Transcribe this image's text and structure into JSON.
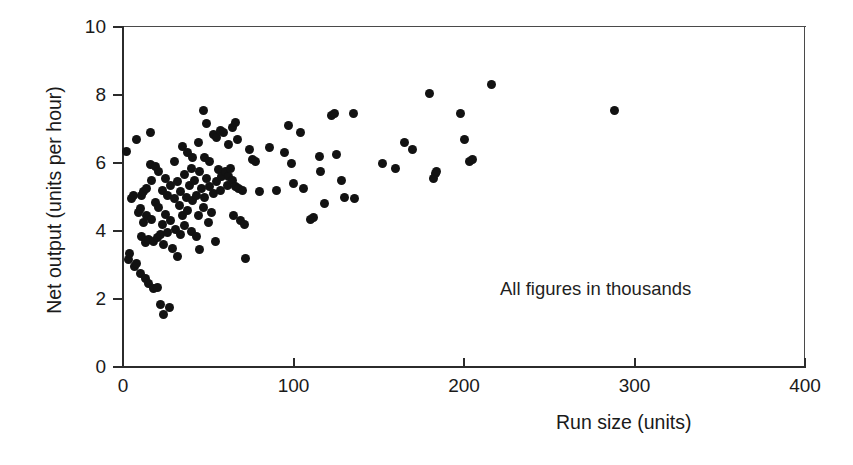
{
  "figure": {
    "background_color": "#ffffff",
    "ink_color": "#121212",
    "frame_color": "#2b2b2b"
  },
  "annotation": {
    "text": "All figures in thousands"
  },
  "chart_data": {
    "type": "scatter",
    "title": "",
    "subtitle": "",
    "xlabel": "Run size (units)",
    "ylabel": "Net output (units per hour)",
    "xlim": [
      0,
      400
    ],
    "ylim": [
      0,
      10
    ],
    "xticks": [
      0,
      100,
      200,
      300,
      400
    ],
    "yticks": [
      0,
      2,
      4,
      6,
      8,
      10
    ],
    "xtick_labels": [
      "0",
      "100",
      "200",
      "300",
      "400"
    ],
    "ytick_labels": [
      "0",
      "2",
      "4",
      "6",
      "8",
      "10"
    ],
    "grid": false,
    "legend": null,
    "legend_position": "none",
    "annotations": [
      {
        "text": "All figures in thousands",
        "x": 222,
        "y": 2.55
      }
    ],
    "marker": {
      "shape": "circle",
      "size": 9,
      "color": "#121212"
    },
    "series": [
      {
        "name": "Production runs",
        "n_points": 152,
        "points": [
          [
            2,
            6.35
          ],
          [
            3,
            3.15
          ],
          [
            4,
            3.35
          ],
          [
            5,
            4.95
          ],
          [
            6,
            5.05
          ],
          [
            7,
            2.95
          ],
          [
            8,
            3.05
          ],
          [
            8,
            6.7
          ],
          [
            9,
            4.55
          ],
          [
            10,
            4.65
          ],
          [
            10,
            2.75
          ],
          [
            11,
            5.05
          ],
          [
            11,
            3.85
          ],
          [
            12,
            5.15
          ],
          [
            12,
            4.25
          ],
          [
            13,
            3.65
          ],
          [
            13,
            2.6
          ],
          [
            14,
            5.25
          ],
          [
            14,
            4.45
          ],
          [
            15,
            3.75
          ],
          [
            15,
            2.45
          ],
          [
            16,
            6.9
          ],
          [
            16,
            5.95
          ],
          [
            17,
            5.5
          ],
          [
            17,
            4.35
          ],
          [
            18,
            3.7
          ],
          [
            18,
            2.3
          ],
          [
            19,
            5.9
          ],
          [
            19,
            4.85
          ],
          [
            20,
            3.8
          ],
          [
            20,
            2.35
          ],
          [
            21,
            5.75
          ],
          [
            21,
            4.7
          ],
          [
            22,
            3.9
          ],
          [
            22,
            1.85
          ],
          [
            23,
            5.2
          ],
          [
            23,
            4.2
          ],
          [
            24,
            3.6
          ],
          [
            24,
            1.55
          ],
          [
            25,
            5.55
          ],
          [
            25,
            4.5
          ],
          [
            26,
            5.05
          ],
          [
            26,
            3.95
          ],
          [
            27,
            1.75
          ],
          [
            28,
            5.35
          ],
          [
            28,
            4.3
          ],
          [
            29,
            3.5
          ],
          [
            30,
            6.05
          ],
          [
            30,
            4.95
          ],
          [
            31,
            4.05
          ],
          [
            32,
            5.45
          ],
          [
            32,
            3.25
          ],
          [
            33,
            4.75
          ],
          [
            34,
            5.15
          ],
          [
            34,
            3.9
          ],
          [
            35,
            6.5
          ],
          [
            35,
            4.45
          ],
          [
            36,
            5.65
          ],
          [
            36,
            4.15
          ],
          [
            37,
            5.0
          ],
          [
            38,
            6.3
          ],
          [
            38,
            4.6
          ],
          [
            39,
            5.35
          ],
          [
            40,
            5.85
          ],
          [
            40,
            4.0
          ],
          [
            41,
            6.15
          ],
          [
            41,
            4.9
          ],
          [
            42,
            5.5
          ],
          [
            43,
            5.05
          ],
          [
            43,
            3.85
          ],
          [
            44,
            6.6
          ],
          [
            44,
            4.45
          ],
          [
            45,
            5.75
          ],
          [
            45,
            3.45
          ],
          [
            46,
            5.25
          ],
          [
            47,
            7.55
          ],
          [
            47,
            4.7
          ],
          [
            48,
            6.15
          ],
          [
            48,
            5.0
          ],
          [
            49,
            7.15
          ],
          [
            49,
            5.55
          ],
          [
            50,
            4.25
          ],
          [
            51,
            6.05
          ],
          [
            51,
            5.3
          ],
          [
            52,
            4.55
          ],
          [
            53,
            6.85
          ],
          [
            53,
            5.1
          ],
          [
            54,
            3.7
          ],
          [
            55,
            6.75
          ],
          [
            55,
            5.45
          ],
          [
            56,
            5.8
          ],
          [
            57,
            6.95
          ],
          [
            57,
            5.2
          ],
          [
            58,
            5.6
          ],
          [
            59,
            6.9
          ],
          [
            60,
            5.75
          ],
          [
            61,
            5.35
          ],
          [
            62,
            6.55
          ],
          [
            62,
            5.6
          ],
          [
            63,
            5.85
          ],
          [
            64,
            7.05
          ],
          [
            64,
            5.5
          ],
          [
            65,
            4.45
          ],
          [
            66,
            7.2
          ],
          [
            66,
            5.3
          ],
          [
            67,
            6.7
          ],
          [
            68,
            5.25
          ],
          [
            69,
            4.3
          ],
          [
            70,
            5.2
          ],
          [
            71,
            4.2
          ],
          [
            72,
            3.2
          ],
          [
            74,
            6.4
          ],
          [
            76,
            6.1
          ],
          [
            78,
            6.05
          ],
          [
            80,
            5.15
          ],
          [
            86,
            6.45
          ],
          [
            90,
            5.2
          ],
          [
            95,
            6.3
          ],
          [
            97,
            7.1
          ],
          [
            99,
            6.0
          ],
          [
            100,
            5.4
          ],
          [
            104,
            6.9
          ],
          [
            106,
            5.25
          ],
          [
            110,
            4.35
          ],
          [
            112,
            4.4
          ],
          [
            115,
            6.2
          ],
          [
            116,
            5.75
          ],
          [
            118,
            4.8
          ],
          [
            122,
            7.4
          ],
          [
            124,
            7.45
          ],
          [
            125,
            6.25
          ],
          [
            128,
            5.5
          ],
          [
            130,
            5.0
          ],
          [
            135,
            7.45
          ],
          [
            136,
            4.95
          ],
          [
            152,
            6.0
          ],
          [
            160,
            5.85
          ],
          [
            165,
            6.6
          ],
          [
            170,
            6.4
          ],
          [
            180,
            8.05
          ],
          [
            182,
            5.55
          ],
          [
            183,
            5.7
          ],
          [
            184,
            5.75
          ],
          [
            198,
            7.45
          ],
          [
            200,
            6.7
          ],
          [
            203,
            6.05
          ],
          [
            205,
            6.1
          ],
          [
            216,
            8.3
          ],
          [
            288,
            7.55
          ]
        ]
      }
    ]
  },
  "axes": {
    "x": {
      "label": "Run size (units)",
      "ticks": [
        {
          "value": 0,
          "label": "0"
        },
        {
          "value": 100,
          "label": "100"
        },
        {
          "value": 200,
          "label": "200"
        },
        {
          "value": 300,
          "label": "300"
        },
        {
          "value": 400,
          "label": "400"
        }
      ]
    },
    "y": {
      "label": "Net output (units per hour)",
      "ticks": [
        {
          "value": 0,
          "label": "0"
        },
        {
          "value": 2,
          "label": "2"
        },
        {
          "value": 4,
          "label": "4"
        },
        {
          "value": 6,
          "label": "6"
        },
        {
          "value": 8,
          "label": "8"
        },
        {
          "value": 10,
          "label": "10"
        }
      ]
    }
  }
}
